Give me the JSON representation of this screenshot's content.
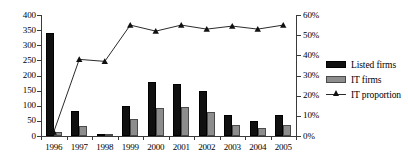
{
  "chart_data": {
    "type": "bar",
    "title": "",
    "subtitle": "",
    "xlabel": "",
    "ylabel": "",
    "y2label": "",
    "categories": [
      "1996",
      "1997",
      "1998",
      "1999",
      "2000",
      "2001",
      "2002",
      "2003",
      "2004",
      "2005"
    ],
    "ylim": [
      0,
      400
    ],
    "y2lim": [
      0,
      0.6
    ],
    "y_ticks": [
      "0",
      "50",
      "100",
      "150",
      "200",
      "250",
      "300",
      "350",
      "400"
    ],
    "y_tick_values": [
      0,
      50,
      100,
      150,
      200,
      250,
      300,
      350,
      400
    ],
    "y2_ticks": [
      "0%",
      "10%",
      "20%",
      "30%",
      "40%",
      "50%",
      "60%"
    ],
    "y2_tick_values": [
      0,
      10,
      20,
      30,
      40,
      50,
      60
    ],
    "grid": false,
    "legend_position": "right",
    "series": [
      {
        "name": "Listed firms",
        "type": "bar",
        "axis": "left",
        "color": "#101010",
        "values": [
          340,
          84,
          7,
          98,
          178,
          171,
          150,
          68,
          50,
          68
        ]
      },
      {
        "name": "IT firms",
        "type": "bar",
        "axis": "left",
        "color": "#8d8d8d",
        "values": [
          13,
          33,
          1,
          55,
          92,
          95,
          78,
          38,
          26,
          36
        ]
      },
      {
        "name": "IT proportion",
        "type": "line",
        "axis": "right",
        "color": "#2b2b2b",
        "marker": "triangle",
        "values": [
          2,
          38,
          37,
          55,
          52,
          55,
          53,
          54.5,
          53,
          55
        ],
        "value_labels": [
          "2%",
          "38%",
          "37%",
          "55%",
          "52%",
          "55%",
          "53%",
          "55%",
          "53%",
          "55%"
        ]
      }
    ]
  },
  "legend": {
    "items": [
      {
        "label": "Listed firms",
        "key": "swatch-black"
      },
      {
        "label": "IT firms",
        "key": "swatch-gray"
      },
      {
        "label": "IT proportion",
        "key": "line-triangle-marker"
      }
    ]
  }
}
